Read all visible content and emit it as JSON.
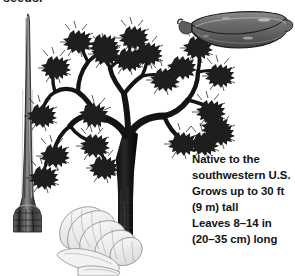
{
  "figure": {
    "width": 295,
    "height": 276,
    "background_color": "#ffffff"
  },
  "caption_fragment": {
    "text": "seeds.",
    "note": "clipped at top edge of image"
  },
  "info_block": {
    "lines": [
      "Native to the",
      "southwestern U.S.",
      "Grows up to 30 ft",
      "(9 m) tall",
      "Leaves 8–14 in",
      "(20–35 cm) long"
    ],
    "text_color": "#141414"
  },
  "illustrations": {
    "tree": {
      "name": "joshua-tree",
      "description": "branching Joshua tree with thick dark trunk and bristly leaf clusters",
      "ink_color": "#141414",
      "midtone_color": "#4a4a4a"
    },
    "leaf": {
      "name": "leaf-blade",
      "description": "long narrow dagger-shaped leaf with flared base",
      "ink_color": "#3d3d3d"
    },
    "seed_pod": {
      "name": "seed-pod",
      "description": "oblong gray seed pod with central seam and small stem nub",
      "fill_color": "#6e6e6e"
    },
    "flower": {
      "name": "flower-bud",
      "description": "pale line-drawn flower bud with striped overlapping petals",
      "ink_color": "#7a7a7a"
    }
  }
}
